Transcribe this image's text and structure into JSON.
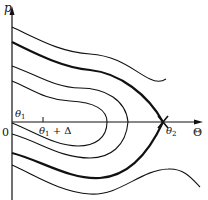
{
  "diagram": {
    "type": "phase-portrait",
    "axes": {
      "y_label": "p",
      "x_label": "Θ",
      "origin_label": "0"
    },
    "annotations": {
      "theta1": {
        "symbol": "θ",
        "subscript": "1"
      },
      "theta1_plus_delta": {
        "symbol": "θ",
        "subscript": "1",
        "suffix": " + Δ"
      },
      "theta2": {
        "symbol": "θ",
        "subscript": "2"
      }
    },
    "curves": [
      {
        "name": "upper-outer-trajectory",
        "style": "thin"
      },
      {
        "name": "separatrix",
        "style": "thick"
      },
      {
        "name": "middle-closed-orbit",
        "style": "thin"
      },
      {
        "name": "inner-closed-orbit",
        "style": "thin"
      },
      {
        "name": "lower-outer-trajectory",
        "style": "thin"
      }
    ],
    "colors": {
      "ink": "#111111",
      "background": "#ffffff"
    }
  }
}
